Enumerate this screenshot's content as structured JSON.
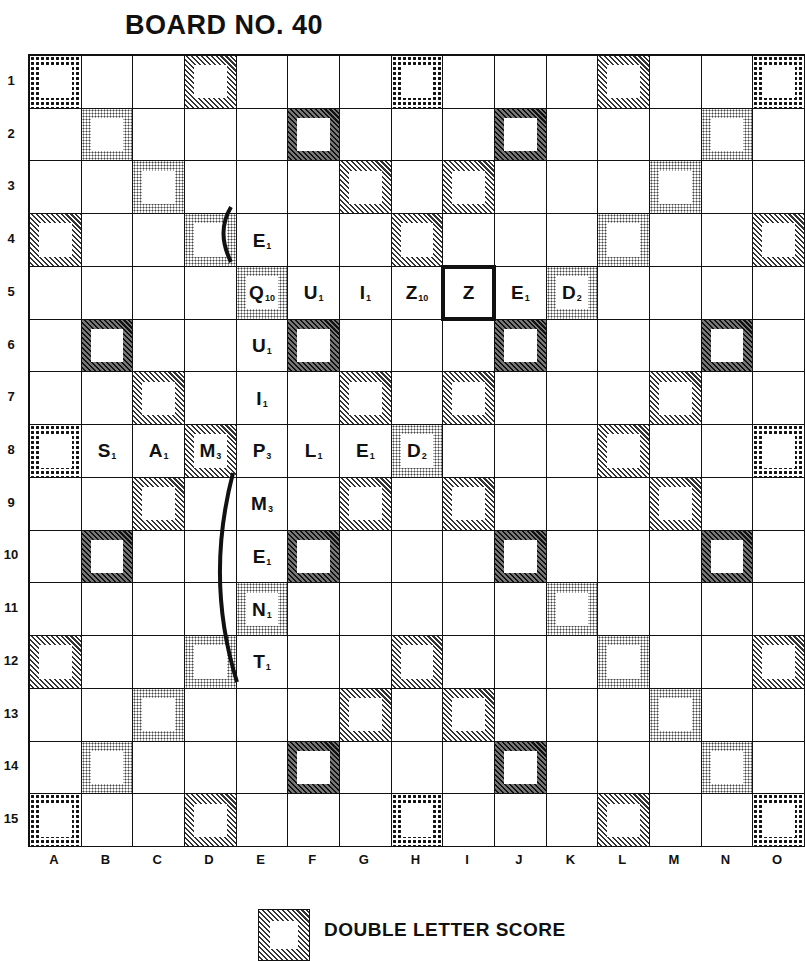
{
  "title": "BOARD NO. 40",
  "rows": [
    "1",
    "2",
    "3",
    "4",
    "5",
    "6",
    "7",
    "8",
    "9",
    "10",
    "11",
    "12",
    "13",
    "14",
    "15"
  ],
  "columns": [
    "A",
    "B",
    "C",
    "D",
    "E",
    "F",
    "G",
    "H",
    "I",
    "J",
    "K",
    "L",
    "M",
    "N",
    "O"
  ],
  "premium_legend": {
    "DL": "light diagonal hatch",
    "TL": "dark diagonal hatch",
    "DW": "fine dot screen",
    "TW": "coarse dot screen"
  },
  "premium_squares": {
    "1": {
      "A": "TW",
      "D": "DL",
      "H": "TW",
      "L": "DL",
      "O": "TW"
    },
    "2": {
      "B": "DW",
      "F": "TL",
      "J": "TL",
      "N": "DW"
    },
    "3": {
      "C": "DW",
      "G": "DL",
      "I": "DL",
      "M": "DW"
    },
    "4": {
      "A": "DL",
      "D": "DW",
      "H": "DL",
      "L": "DW",
      "O": "DL"
    },
    "5": {
      "E": "DW",
      "K": "DW"
    },
    "6": {
      "B": "TL",
      "F": "TL",
      "J": "TL",
      "N": "TL"
    },
    "7": {
      "C": "DL",
      "G": "DL",
      "I": "DL",
      "M": "DL"
    },
    "8": {
      "A": "TW",
      "D": "DL",
      "H": "DW",
      "L": "DL",
      "O": "TW"
    },
    "9": {
      "C": "DL",
      "G": "DL",
      "I": "DL",
      "M": "DL"
    },
    "10": {
      "B": "TL",
      "F": "TL",
      "J": "TL",
      "N": "TL"
    },
    "11": {
      "E": "DW",
      "K": "DW"
    },
    "12": {
      "A": "DL",
      "D": "DW",
      "H": "DL",
      "L": "DW",
      "O": "DL"
    },
    "13": {
      "C": "DW",
      "G": "DL",
      "I": "DL",
      "M": "DW"
    },
    "14": {
      "B": "DW",
      "F": "TL",
      "J": "TL",
      "N": "DW"
    },
    "15": {
      "A": "TW",
      "D": "DL",
      "H": "TW",
      "L": "DL",
      "O": "TW"
    }
  },
  "tiles": [
    {
      "pos": "E4",
      "letter": "E",
      "value": "1"
    },
    {
      "pos": "E5",
      "letter": "Q",
      "value": "10"
    },
    {
      "pos": "F5",
      "letter": "U",
      "value": "1"
    },
    {
      "pos": "G5",
      "letter": "I",
      "value": "1"
    },
    {
      "pos": "H5",
      "letter": "Z",
      "value": "10"
    },
    {
      "pos": "I5",
      "letter": "Z",
      "value": "",
      "blank": true,
      "highlighted": true
    },
    {
      "pos": "J5",
      "letter": "E",
      "value": "1"
    },
    {
      "pos": "K5",
      "letter": "D",
      "value": "2"
    },
    {
      "pos": "E6",
      "letter": "U",
      "value": "1"
    },
    {
      "pos": "E7",
      "letter": "I",
      "value": "1"
    },
    {
      "pos": "B8",
      "letter": "S",
      "value": "1"
    },
    {
      "pos": "C8",
      "letter": "A",
      "value": "1"
    },
    {
      "pos": "D8",
      "letter": "M",
      "value": "3"
    },
    {
      "pos": "E8",
      "letter": "P",
      "value": "3"
    },
    {
      "pos": "F8",
      "letter": "L",
      "value": "1"
    },
    {
      "pos": "G8",
      "letter": "E",
      "value": "1"
    },
    {
      "pos": "H8",
      "letter": "D",
      "value": "2"
    },
    {
      "pos": "E9",
      "letter": "M",
      "value": "3"
    },
    {
      "pos": "E10",
      "letter": "E",
      "value": "1"
    },
    {
      "pos": "E11",
      "letter": "N",
      "value": "1"
    },
    {
      "pos": "E12",
      "letter": "T",
      "value": "1"
    }
  ],
  "words": [
    "QUIZZED",
    "SAMPLED",
    "EQUIPMENT"
  ],
  "brackets": [
    {
      "from": "D4/E4 top",
      "to": "D4/E4 bottom"
    },
    {
      "from": "D9/E9 top",
      "to": "D12/E12 bottom"
    }
  ],
  "legend": [
    {
      "type": "DL",
      "label": "DOUBLE LETTER SCORE"
    }
  ]
}
